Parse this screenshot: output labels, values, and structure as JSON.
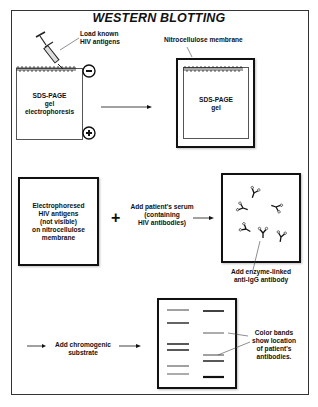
{
  "title": "WESTERN BLOTTING",
  "step1": {
    "syringe_label_line1": "Load known",
    "syringe_label_line2": "HIV antigens",
    "gel_label_line1": "SDS-PAGE",
    "gel_label_line2": "gel",
    "gel_label_line3": "electrophoresis",
    "minus_symbol": "−",
    "plus_symbol": "+"
  },
  "step2": {
    "membrane_label": "Nitrocellulose membrane",
    "gel_label_line1": "SDS-PAGE",
    "gel_label_line2": "gel"
  },
  "step3": {
    "membrane_label_line1": "Electrophoresed",
    "membrane_label_line2": "HIV antigens",
    "membrane_label_line3": "(not visible)",
    "membrane_label_line4": "on nitrocellulose",
    "membrane_label_line5": "membrane",
    "plus_symbol": "+",
    "serum_label_line1": "Add patient's serum",
    "serum_label_line2": "(containing",
    "serum_label_line3": "HIV antibodies)"
  },
  "step4": {
    "antibody_label_line1": "Add enzyme-linked",
    "antibody_label_line2": "anti-IgG antibody"
  },
  "step5": {
    "substrate_label_line1": "Add chromogenic",
    "substrate_label_line2": "substrate",
    "bands_label_line1": "Color bands",
    "bands_label_line2": "show location",
    "bands_label_line3": "of patient's",
    "bands_label_line4": "antibodies."
  },
  "icons": {
    "syringe": "syringe-icon",
    "antibody": "antibody-icon",
    "arrow": "arrow-right-icon"
  },
  "colors": {
    "ink": "#111111",
    "frame": "#333333",
    "background": "#ffffff"
  }
}
